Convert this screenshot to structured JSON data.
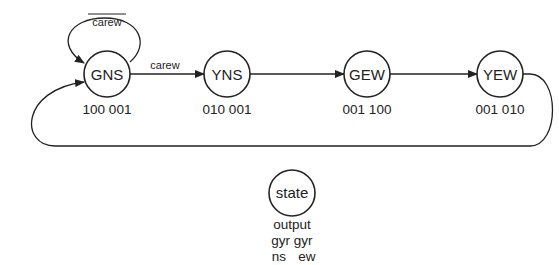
{
  "diagram": {
    "type": "finite-state-machine",
    "states": [
      {
        "id": "GNS",
        "label": "GNS",
        "output": "100 001",
        "cx": 107,
        "cy": 74
      },
      {
        "id": "YNS",
        "label": "YNS",
        "output": "010 001",
        "cx": 227,
        "cy": 74
      },
      {
        "id": "GEW",
        "label": "GEW",
        "output": "001 100",
        "cx": 367,
        "cy": 74
      },
      {
        "id": "YEW",
        "label": "YEW",
        "output": "001 010",
        "cx": 500,
        "cy": 74
      }
    ],
    "transitions": [
      {
        "from": "GNS",
        "to": "GNS",
        "label": "carew",
        "negated": true
      },
      {
        "from": "GNS",
        "to": "YNS",
        "label": "carew",
        "negated": false
      },
      {
        "from": "YNS",
        "to": "GEW",
        "label": ""
      },
      {
        "from": "GEW",
        "to": "YEW",
        "label": ""
      },
      {
        "from": "YEW",
        "to": "GNS",
        "label": ""
      }
    ],
    "legend": {
      "state_label": "state",
      "line1": "output",
      "line2": "gyr gyr",
      "line3_left": "ns",
      "line3_right": "ew"
    }
  }
}
